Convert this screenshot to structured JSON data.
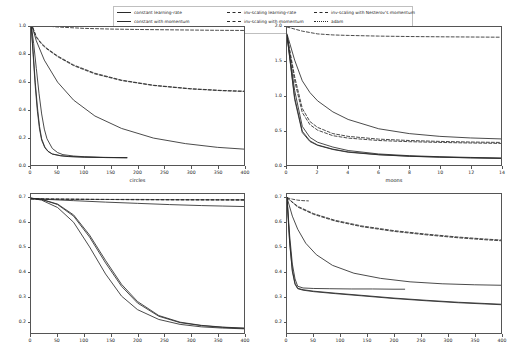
{
  "figure": {
    "width": 517,
    "height": 360,
    "background": "#ffffff",
    "line_color": "#2a2a2a",
    "axis_color": "#555555"
  },
  "legend": {
    "position": "upper-center",
    "border_color": "#bfbfbf",
    "items": [
      {
        "label": "constant learning-rate",
        "style": "solid",
        "column": 1
      },
      {
        "label": "constant with momentum",
        "style": "solid",
        "column": 1
      },
      {
        "label": "constant with Nesterov's momentum",
        "style": "solid",
        "column": 1
      },
      {
        "label": "inv-scaling learning-rate",
        "style": "dashed",
        "column": 2
      },
      {
        "label": "inv-scaling with momentum",
        "style": "dashed",
        "column": 2
      },
      {
        "label": "inv-scaling with Nesterov's momentum",
        "style": "dashed",
        "column": 3
      },
      {
        "label": "adam",
        "style": "dashdot",
        "column": 3
      }
    ]
  },
  "chart_data": [
    {
      "id": "circles",
      "type": "line",
      "title": "circles",
      "xlabel": "",
      "ylabel": "",
      "xlim": [
        0,
        400
      ],
      "ylim": [
        0.0,
        1.0
      ],
      "xticks": [
        0,
        50,
        100,
        150,
        200,
        250,
        300,
        350,
        400
      ],
      "yticks": [
        0.0,
        0.2,
        0.4,
        0.6,
        0.8,
        1.0
      ],
      "grid": false,
      "series": [
        {
          "name": "constant learning-rate",
          "style": "solid",
          "x": [
            0,
            5,
            10,
            15,
            20,
            25,
            30,
            40,
            50,
            60,
            80,
            100,
            130,
            160,
            180
          ],
          "y": [
            1.03,
            0.88,
            0.7,
            0.52,
            0.37,
            0.26,
            0.19,
            0.12,
            0.09,
            0.075,
            0.065,
            0.06,
            0.056,
            0.054,
            0.053
          ]
        },
        {
          "name": "constant with momentum",
          "style": "solid",
          "x": [
            0,
            4,
            8,
            12,
            16,
            20,
            26,
            32,
            40,
            55,
            70,
            100,
            140,
            180
          ],
          "y": [
            1.03,
            0.82,
            0.6,
            0.42,
            0.28,
            0.19,
            0.13,
            0.1,
            0.08,
            0.068,
            0.062,
            0.057,
            0.054,
            0.053
          ]
        },
        {
          "name": "constant with Nesterov's momentum",
          "style": "solid",
          "x": [
            0,
            4,
            8,
            12,
            16,
            20,
            26,
            32,
            40,
            55,
            70,
            100,
            140,
            180
          ],
          "y": [
            1.03,
            0.8,
            0.57,
            0.39,
            0.26,
            0.18,
            0.125,
            0.098,
            0.079,
            0.067,
            0.061,
            0.057,
            0.054,
            0.053
          ]
        },
        {
          "name": "inv-scaling learning-rate",
          "style": "dashed",
          "x": [
            0,
            20,
            50,
            100,
            150,
            200,
            250,
            300,
            350,
            400
          ],
          "y": [
            1.03,
            1.01,
            1.0,
            0.99,
            0.985,
            0.982,
            0.98,
            0.978,
            0.976,
            0.975
          ]
        },
        {
          "name": "inv-scaling with momentum",
          "style": "dashed",
          "x": [
            0,
            10,
            20,
            30,
            50,
            80,
            120,
            170,
            230,
            300,
            360,
            400
          ],
          "y": [
            1.03,
            0.93,
            0.88,
            0.845,
            0.79,
            0.725,
            0.665,
            0.615,
            0.578,
            0.553,
            0.54,
            0.535
          ]
        },
        {
          "name": "inv-scaling with Nesterov's momentum",
          "style": "dashed",
          "x": [
            0,
            10,
            20,
            30,
            50,
            80,
            120,
            170,
            230,
            300,
            360,
            400
          ],
          "y": [
            1.03,
            0.925,
            0.875,
            0.84,
            0.785,
            0.72,
            0.66,
            0.612,
            0.576,
            0.551,
            0.538,
            0.533
          ]
        },
        {
          "name": "adam",
          "style": "solid",
          "x": [
            0,
            10,
            25,
            50,
            80,
            120,
            170,
            230,
            290,
            350,
            400
          ],
          "y": [
            1.03,
            0.9,
            0.76,
            0.6,
            0.47,
            0.355,
            0.265,
            0.195,
            0.155,
            0.128,
            0.115
          ]
        }
      ]
    },
    {
      "id": "moons",
      "type": "line",
      "title": "moons",
      "xlabel": "",
      "ylabel": "",
      "xlim": [
        0,
        14
      ],
      "ylim": [
        0.0,
        2.0
      ],
      "xticks": [
        0,
        2,
        4,
        6,
        8,
        10,
        12,
        14
      ],
      "yticks": [
        0.0,
        0.5,
        1.0,
        1.5,
        2.0
      ],
      "grid": false,
      "series": [
        {
          "name": "constant learning-rate",
          "style": "solid",
          "x": [
            0,
            0.5,
            1,
            1.5,
            2,
            3,
            4,
            6,
            8,
            10,
            12,
            14
          ],
          "y": [
            1.88,
            1.08,
            0.56,
            0.4,
            0.33,
            0.26,
            0.21,
            0.16,
            0.135,
            0.12,
            0.11,
            0.1
          ]
        },
        {
          "name": "constant with momentum",
          "style": "solid",
          "x": [
            0,
            0.5,
            1,
            1.5,
            2,
            3,
            4,
            6,
            8,
            10,
            12,
            14
          ],
          "y": [
            1.88,
            0.98,
            0.49,
            0.35,
            0.29,
            0.23,
            0.19,
            0.15,
            0.128,
            0.115,
            0.105,
            0.098
          ]
        },
        {
          "name": "constant with Nesterov's momentum",
          "style": "solid",
          "x": [
            0,
            0.5,
            1,
            1.5,
            2,
            3,
            4,
            6,
            8,
            10,
            12,
            14
          ],
          "y": [
            1.88,
            0.95,
            0.47,
            0.34,
            0.285,
            0.225,
            0.185,
            0.148,
            0.126,
            0.113,
            0.103,
            0.096
          ]
        },
        {
          "name": "inv-scaling learning-rate",
          "style": "dashed",
          "x": [
            0,
            1,
            2,
            3,
            4,
            6,
            8,
            10,
            12,
            14
          ],
          "y": [
            2.0,
            1.94,
            1.9,
            1.885,
            1.878,
            1.868,
            1.862,
            1.858,
            1.855,
            1.852
          ]
        },
        {
          "name": "inv-scaling with momentum",
          "style": "dashed",
          "x": [
            0,
            0.5,
            1,
            1.5,
            2,
            3,
            4,
            6,
            8,
            10,
            12,
            14
          ],
          "y": [
            1.88,
            1.28,
            0.82,
            0.63,
            0.545,
            0.455,
            0.415,
            0.375,
            0.355,
            0.342,
            0.333,
            0.327
          ]
        },
        {
          "name": "inv-scaling with Nesterov's momentum",
          "style": "dashed",
          "x": [
            0,
            0.5,
            1,
            1.5,
            2,
            3,
            4,
            6,
            8,
            10,
            12,
            14
          ],
          "y": [
            1.88,
            1.22,
            0.76,
            0.585,
            0.505,
            0.425,
            0.39,
            0.355,
            0.338,
            0.327,
            0.319,
            0.313
          ]
        },
        {
          "name": "adam",
          "style": "solid",
          "x": [
            0,
            0.5,
            1,
            1.5,
            2,
            3,
            4,
            6,
            8,
            10,
            12,
            14
          ],
          "y": [
            1.9,
            1.52,
            1.22,
            1.05,
            0.93,
            0.77,
            0.66,
            0.525,
            0.455,
            0.415,
            0.392,
            0.378
          ]
        }
      ]
    },
    {
      "id": "bottom-left",
      "type": "line",
      "title": "",
      "xlabel": "",
      "ylabel": "",
      "xlim": [
        0,
        400
      ],
      "ylim": [
        0.15,
        0.715
      ],
      "xticks": [
        0,
        50,
        100,
        150,
        200,
        250,
        300,
        350,
        400
      ],
      "yticks": [
        0.2,
        0.3,
        0.4,
        0.5,
        0.6,
        0.7
      ],
      "grid": false,
      "series": [
        {
          "name": "constant learning-rate",
          "style": "solid",
          "x": [
            0,
            20,
            50,
            80,
            110,
            140,
            170,
            200,
            240,
            280,
            320,
            360,
            400
          ],
          "y": [
            0.698,
            0.69,
            0.66,
            0.6,
            0.5,
            0.39,
            0.3,
            0.245,
            0.205,
            0.185,
            0.175,
            0.17,
            0.167
          ]
        },
        {
          "name": "constant with momentum",
          "style": "solid",
          "x": [
            0,
            20,
            50,
            80,
            110,
            140,
            170,
            200,
            240,
            280,
            320,
            360,
            400
          ],
          "y": [
            0.698,
            0.693,
            0.672,
            0.625,
            0.54,
            0.435,
            0.34,
            0.272,
            0.218,
            0.192,
            0.18,
            0.173,
            0.169
          ]
        },
        {
          "name": "constant with Nesterov's momentum",
          "style": "solid",
          "x": [
            0,
            20,
            50,
            80,
            110,
            140,
            170,
            200,
            240,
            280,
            320,
            360,
            400
          ],
          "y": [
            0.698,
            0.693,
            0.674,
            0.63,
            0.548,
            0.445,
            0.348,
            0.278,
            0.221,
            0.194,
            0.181,
            0.174,
            0.17
          ]
        },
        {
          "name": "inv-scaling learning-rate",
          "style": "dashed",
          "x": [
            0,
            50,
            120,
            200,
            280,
            350,
            400
          ],
          "y": [
            0.695,
            0.694,
            0.693,
            0.693,
            0.692,
            0.692,
            0.692
          ]
        },
        {
          "name": "inv-scaling with momentum",
          "style": "dashed",
          "x": [
            0,
            50,
            120,
            200,
            280,
            350,
            400
          ],
          "y": [
            0.695,
            0.694,
            0.693,
            0.692,
            0.692,
            0.691,
            0.691
          ]
        },
        {
          "name": "inv-scaling with Nesterov's momentum",
          "style": "dashed",
          "x": [
            0,
            50,
            120,
            200,
            280,
            350,
            400
          ],
          "y": [
            0.695,
            0.694,
            0.693,
            0.692,
            0.691,
            0.691,
            0.69
          ]
        },
        {
          "name": "adam",
          "style": "solid",
          "x": [
            0,
            30,
            80,
            140,
            200,
            260,
            320,
            360,
            400
          ],
          "y": [
            0.697,
            0.693,
            0.688,
            0.682,
            0.677,
            0.672,
            0.668,
            0.666,
            0.664
          ]
        }
      ]
    },
    {
      "id": "bottom-right",
      "type": "line",
      "title": "",
      "xlabel": "",
      "ylabel": "",
      "xlim": [
        0,
        400
      ],
      "ylim": [
        0.15,
        0.715
      ],
      "xticks": [
        0,
        50,
        100,
        150,
        200,
        250,
        300,
        350,
        400
      ],
      "yticks": [
        0.2,
        0.3,
        0.4,
        0.5,
        0.6,
        0.7
      ],
      "grid": false,
      "series": [
        {
          "name": "constant learning-rate",
          "style": "solid",
          "x": [
            0,
            5,
            10,
            15,
            20,
            30,
            50,
            80,
            120,
            160,
            200,
            220
          ],
          "y": [
            0.7,
            0.545,
            0.43,
            0.37,
            0.34,
            0.333,
            0.331,
            0.33,
            0.329,
            0.329,
            0.328,
            0.328
          ]
        },
        {
          "name": "constant with momentum",
          "style": "solid",
          "x": [
            0,
            5,
            10,
            15,
            20,
            30,
            50,
            90,
            140,
            200,
            260,
            320,
            370,
            400
          ],
          "y": [
            0.7,
            0.52,
            0.405,
            0.352,
            0.332,
            0.326,
            0.32,
            0.312,
            0.303,
            0.292,
            0.283,
            0.275,
            0.27,
            0.267
          ]
        },
        {
          "name": "constant with Nesterov's momentum",
          "style": "solid",
          "x": [
            0,
            5,
            10,
            15,
            20,
            30,
            50,
            90,
            140,
            200,
            260,
            320,
            370,
            400
          ],
          "y": [
            0.7,
            0.515,
            0.4,
            0.348,
            0.33,
            0.324,
            0.318,
            0.31,
            0.301,
            0.29,
            0.281,
            0.273,
            0.268,
            0.265
          ]
        },
        {
          "name": "inv-scaling learning-rate",
          "style": "dashed",
          "x": [
            0,
            10,
            20,
            30,
            40
          ],
          "y": [
            0.7,
            0.694,
            0.69,
            0.688,
            0.687
          ]
        },
        {
          "name": "inv-scaling with momentum",
          "style": "dashed",
          "x": [
            0,
            20,
            50,
            90,
            140,
            200,
            260,
            320,
            370,
            400
          ],
          "y": [
            0.7,
            0.665,
            0.635,
            0.608,
            0.585,
            0.566,
            0.552,
            0.54,
            0.532,
            0.528
          ]
        },
        {
          "name": "inv-scaling with Nesterov's momentum",
          "style": "dashed",
          "x": [
            0,
            20,
            50,
            90,
            140,
            200,
            260,
            320,
            370,
            400
          ],
          "y": [
            0.7,
            0.662,
            0.632,
            0.605,
            0.582,
            0.563,
            0.549,
            0.537,
            0.529,
            0.525
          ]
        },
        {
          "name": "adam",
          "style": "solid",
          "x": [
            0,
            10,
            20,
            35,
            55,
            85,
            125,
            175,
            230,
            290,
            350,
            400
          ],
          "y": [
            0.7,
            0.625,
            0.572,
            0.515,
            0.468,
            0.425,
            0.393,
            0.372,
            0.358,
            0.35,
            0.346,
            0.344
          ]
        }
      ]
    }
  ]
}
